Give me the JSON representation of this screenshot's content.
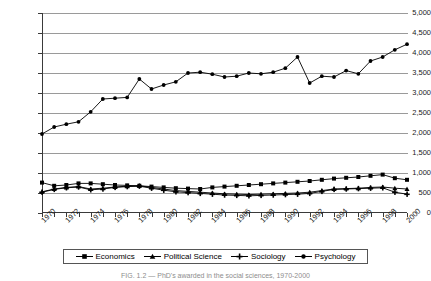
{
  "chart_data": {
    "type": "line",
    "title": "",
    "xlabel": "",
    "ylabel": "",
    "ylim": [
      0,
      5000
    ],
    "ytick_values": [
      0,
      500,
      1000,
      1500,
      2000,
      2500,
      3000,
      3500,
      4000,
      4500,
      5000
    ],
    "ytick_labels": [
      "0",
      "500",
      "1,000",
      "1,500",
      "2,000",
      "2,500",
      "3,000",
      "3,500",
      "4,000",
      "4,500",
      "5,000"
    ],
    "grid": true,
    "legend_position": "bottom",
    "x": [
      1970,
      1971,
      1972,
      1973,
      1974,
      1975,
      1976,
      1977,
      1978,
      1979,
      1980,
      1981,
      1982,
      1983,
      1984,
      1985,
      1986,
      1987,
      1988,
      1989,
      1990,
      1991,
      1992,
      1993,
      1994,
      1995,
      1996,
      1997,
      1998,
      1999,
      2000
    ],
    "xtick_labels": [
      "1970",
      "1972",
      "1974",
      "1976",
      "1978",
      "1980",
      "1982",
      "1984",
      "1986",
      "1988",
      "1990",
      "1992",
      "1994",
      "1996",
      "1998",
      "2000"
    ],
    "xtick_every": 2,
    "series": [
      {
        "name": "Economics",
        "marker": "square",
        "values": [
          760,
          680,
          700,
          740,
          740,
          720,
          700,
          690,
          680,
          660,
          640,
          620,
          610,
          600,
          640,
          660,
          680,
          700,
          720,
          740,
          760,
          780,
          800,
          830,
          860,
          880,
          900,
          930,
          960,
          870,
          830
        ]
      },
      {
        "name": "Political Science",
        "marker": "triangle",
        "values": [
          530,
          600,
          640,
          660,
          600,
          620,
          650,
          670,
          680,
          640,
          600,
          560,
          540,
          520,
          500,
          480,
          470,
          460,
          470,
          480,
          490,
          500,
          520,
          560,
          600,
          610,
          620,
          640,
          650,
          620,
          600
        ]
      },
      {
        "name": "Sociology",
        "marker": "plus",
        "values": [
          520,
          590,
          630,
          650,
          580,
          600,
          640,
          660,
          670,
          620,
          570,
          530,
          510,
          490,
          470,
          450,
          440,
          430,
          440,
          450,
          460,
          470,
          490,
          540,
          590,
          600,
          610,
          620,
          630,
          520,
          470
        ]
      },
      {
        "name": "Psychology",
        "marker": "circle",
        "values": [
          1975,
          2150,
          2220,
          2280,
          2530,
          2850,
          2870,
          2890,
          3350,
          3100,
          3200,
          3280,
          3500,
          3520,
          3470,
          3400,
          3420,
          3500,
          3480,
          3520,
          3620,
          3900,
          3250,
          3420,
          3400,
          3560,
          3480,
          3800,
          3900,
          4080,
          4220
        ]
      }
    ]
  },
  "caption": {
    "text": "FIG. 1.2 — PhD's awarded in the social sciences, 1970-2000"
  }
}
